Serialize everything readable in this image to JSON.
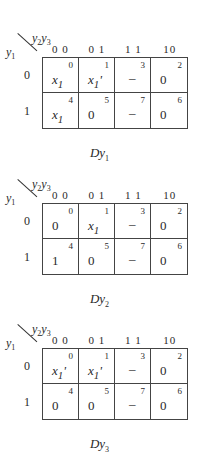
{
  "col_var_label": "y2y3",
  "row_var_label": "y1",
  "col_headers": [
    "0 0",
    "0 1",
    "1 1",
    "10"
  ],
  "row_headers": [
    "0",
    "1"
  ],
  "maps": [
    {
      "title": "Dy1",
      "cells": [
        {
          "minterm": "0",
          "value": "x1"
        },
        {
          "minterm": "1",
          "value": "x1'"
        },
        {
          "minterm": "3",
          "value": "–"
        },
        {
          "minterm": "2",
          "value": "0"
        },
        {
          "minterm": "4",
          "value": "x1"
        },
        {
          "minterm": "5",
          "value": "0"
        },
        {
          "minterm": "7",
          "value": "–"
        },
        {
          "minterm": "6",
          "value": "0"
        }
      ]
    },
    {
      "title": "Dy2",
      "cells": [
        {
          "minterm": "0",
          "value": "0"
        },
        {
          "minterm": "1",
          "value": "x1"
        },
        {
          "minterm": "3",
          "value": "–"
        },
        {
          "minterm": "2",
          "value": "0"
        },
        {
          "minterm": "4",
          "value": "1"
        },
        {
          "minterm": "5",
          "value": "0"
        },
        {
          "minterm": "7",
          "value": "–"
        },
        {
          "minterm": "6",
          "value": "0"
        }
      ]
    },
    {
      "title": "Dy3",
      "cells": [
        {
          "minterm": "0",
          "value": "x1'"
        },
        {
          "minterm": "1",
          "value": "x1'"
        },
        {
          "minterm": "3",
          "value": "–"
        },
        {
          "minterm": "2",
          "value": "0"
        },
        {
          "minterm": "4",
          "value": "0"
        },
        {
          "minterm": "5",
          "value": "0"
        },
        {
          "minterm": "7",
          "value": "–"
        },
        {
          "minterm": "6",
          "value": "0"
        }
      ]
    }
  ]
}
